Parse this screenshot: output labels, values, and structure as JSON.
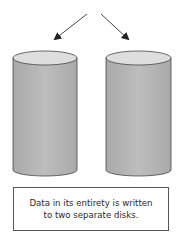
{
  "diagram": {
    "type": "RAID 1 mirroring illustration",
    "arrows": [
      {
        "name": "left-arrow",
        "from": [
          87,
          14
        ],
        "to": [
          54,
          40
        ]
      },
      {
        "name": "right-arrow",
        "from": [
          101,
          14
        ],
        "to": [
          129,
          40
        ]
      }
    ],
    "disks": [
      {
        "name": "disk-1",
        "x": 13,
        "width": 64
      },
      {
        "name": "disk-2",
        "x": 106,
        "width": 65
      }
    ],
    "colors": {
      "disk_body": "#b4b4b4",
      "disk_top": "#dcdcdc",
      "outline": "#444444",
      "arrow": "#333333"
    }
  },
  "caption": {
    "line1": "Data in its entirety is written",
    "line2": "to two separate disks."
  }
}
